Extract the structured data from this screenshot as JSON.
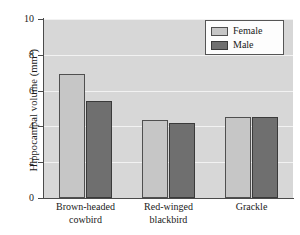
{
  "chart_data": {
    "type": "bar",
    "title": "",
    "xlabel": "",
    "ylabel": "Hippocampal volume (mm",
    "ylabel_exponent": "3",
    "ylabel_suffix": ")",
    "ylim": [
      0,
      10
    ],
    "yticks": [
      0,
      2,
      4,
      6,
      8,
      10
    ],
    "ytick_labels": [
      "0",
      "2",
      "4",
      "6",
      "8",
      "10"
    ],
    "grid": true,
    "grid_color": "#f2f2f2",
    "plot_background": "#d7d7d7",
    "legend_position": "top-right",
    "categories": [
      "Brown-headed cowbird",
      "Red-winged blackbird",
      "Grackle"
    ],
    "category_lines": [
      [
        "Brown-headed",
        "cowbird"
      ],
      [
        "Red-winged",
        "blackbird"
      ],
      [
        "Grackle"
      ]
    ],
    "series": [
      {
        "name": "Female",
        "color": "#c6c6c6",
        "values": [
          6.9,
          4.35,
          4.5
        ]
      },
      {
        "name": "Male",
        "color": "#6f6f6f",
        "values": [
          5.4,
          4.2,
          4.55
        ]
      }
    ]
  },
  "legend": {
    "entries": [
      {
        "label": "Female"
      },
      {
        "label": "Male"
      }
    ]
  }
}
